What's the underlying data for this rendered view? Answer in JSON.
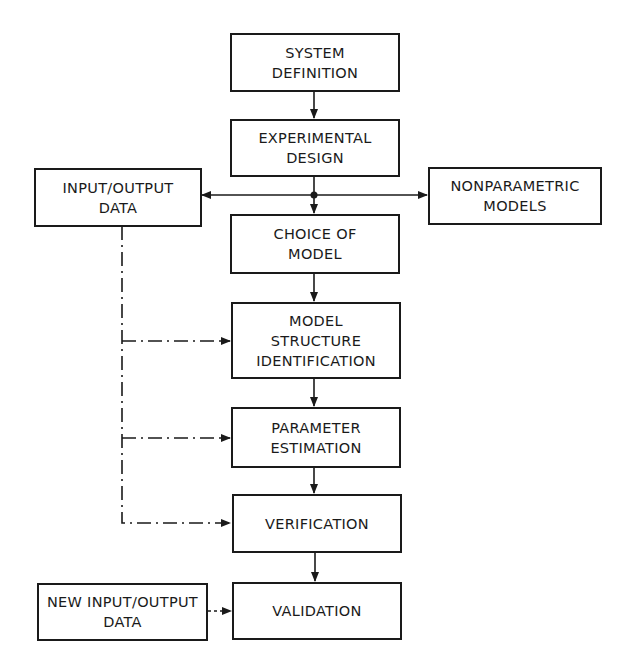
{
  "diagram": {
    "type": "flowchart",
    "nodes": {
      "system_definition": {
        "lines": [
          "SYSTEM",
          "DEFINITION"
        ]
      },
      "experimental_design": {
        "lines": [
          "EXPERIMENTAL",
          "DESIGN"
        ]
      },
      "input_output_data": {
        "lines": [
          "INPUT/OUTPUT",
          "DATA"
        ]
      },
      "nonparametric_models": {
        "lines": [
          "NONPARAMETRIC",
          "MODELS"
        ]
      },
      "choice_of_model": {
        "lines": [
          "CHOICE OF",
          "MODEL"
        ]
      },
      "model_structure_identification": {
        "lines": [
          "MODEL",
          "STRUCTURE",
          "IDENTIFICATION"
        ]
      },
      "parameter_estimation": {
        "lines": [
          "PARAMETER",
          "ESTIMATION"
        ]
      },
      "verification": {
        "lines": [
          "VERIFICATION"
        ]
      },
      "new_input_output_data": {
        "lines": [
          "NEW INPUT/OUTPUT",
          "DATA"
        ]
      },
      "validation": {
        "lines": [
          "VALIDATION"
        ]
      }
    },
    "edges": [
      {
        "from": "system_definition",
        "to": "experimental_design",
        "style": "solid"
      },
      {
        "from": "experimental_design",
        "to": "input_output_data",
        "style": "solid"
      },
      {
        "from": "experimental_design",
        "to": "nonparametric_models",
        "style": "solid"
      },
      {
        "from": "experimental_design",
        "to": "choice_of_model",
        "style": "solid"
      },
      {
        "from": "choice_of_model",
        "to": "model_structure_identification",
        "style": "solid"
      },
      {
        "from": "model_structure_identification",
        "to": "parameter_estimation",
        "style": "solid"
      },
      {
        "from": "parameter_estimation",
        "to": "verification",
        "style": "solid"
      },
      {
        "from": "verification",
        "to": "validation",
        "style": "solid"
      },
      {
        "from": "input_output_data",
        "to": "model_structure_identification",
        "style": "dash-dot"
      },
      {
        "from": "input_output_data",
        "to": "parameter_estimation",
        "style": "dash-dot"
      },
      {
        "from": "input_output_data",
        "to": "verification",
        "style": "dash-dot"
      },
      {
        "from": "new_input_output_data",
        "to": "validation",
        "style": "dotted"
      }
    ],
    "colors": {
      "line": "#1a1a1a",
      "background": "#ffffff"
    }
  }
}
